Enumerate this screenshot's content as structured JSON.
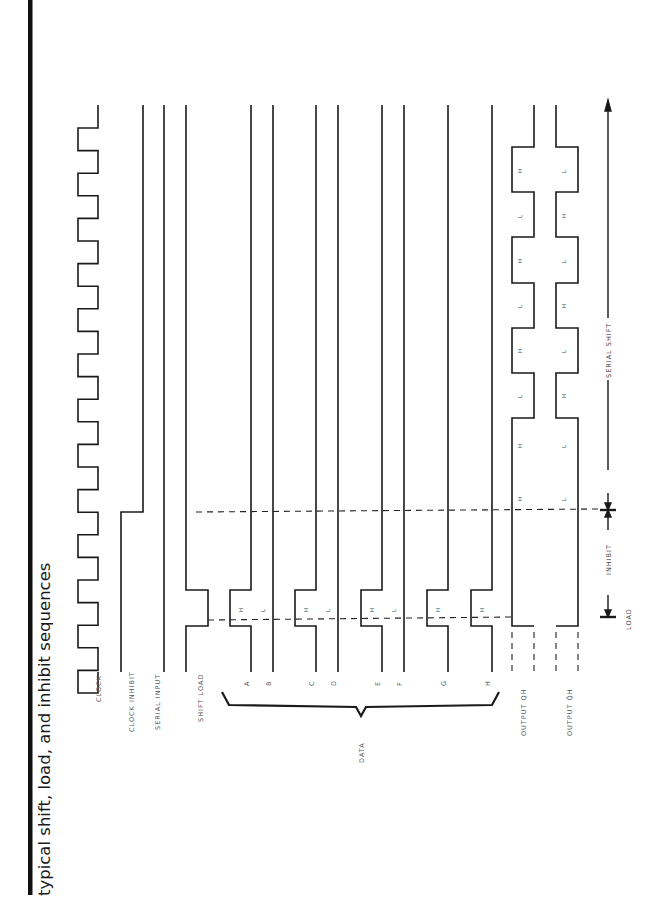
{
  "page": {
    "title": "typical shift, load, and inhibit sequences",
    "orientation": "rotated-90-ccw"
  },
  "signals": [
    {
      "id": "clock",
      "label": "CLOCK",
      "x": 98
    },
    {
      "id": "clock-inhibit",
      "label": "CLOCK INHIBIT",
      "x": 143
    },
    {
      "id": "serial-input",
      "label": "SERIAL INPUT",
      "x": 164
    },
    {
      "id": "shift-load",
      "label": "SHIFT LOAD",
      "x": 186
    },
    {
      "id": "data-a",
      "label": "A",
      "x": 251,
      "level": "H"
    },
    {
      "id": "data-b",
      "label": "B",
      "x": 273,
      "level": "L"
    },
    {
      "id": "data-c",
      "label": "C",
      "x": 316,
      "level": "H"
    },
    {
      "id": "data-d",
      "label": "D",
      "x": 338,
      "level": "L"
    },
    {
      "id": "data-e",
      "label": "E",
      "x": 382,
      "level": "H"
    },
    {
      "id": "data-f",
      "label": "F",
      "x": 404,
      "level": "L"
    },
    {
      "id": "data-g",
      "label": "G",
      "x": 448,
      "level": "H"
    },
    {
      "id": "data-h",
      "label": "H",
      "x": 492,
      "level": "H"
    },
    {
      "id": "output-qh",
      "label": "OUTPUT QH",
      "x": 534
    },
    {
      "id": "output-qh-bar",
      "label": "OUTPUT Q̄H",
      "x": 578
    }
  ],
  "labels": {
    "data_group": "DATA",
    "serial_shift": "SERIAL SHIFT",
    "inhibit": "INHIBIT",
    "load": "LOAD"
  },
  "chart_data": {
    "type": "timing-diagram",
    "title": "typical shift, load, and inhibit sequences",
    "time_axis": "vertical (top = later, bottom = earlier; rotated page)",
    "phases": [
      "LOAD",
      "INHIBIT",
      "SERIAL SHIFT"
    ],
    "data_inputs": {
      "A": "H",
      "B": "L",
      "C": "H",
      "D": "L",
      "E": "H",
      "F": "L",
      "G": "H",
      "H": "H"
    },
    "output_qh_sequence": [
      "H",
      "H",
      "L",
      "H",
      "L",
      "H",
      "L",
      "H"
    ],
    "output_qh_bar_sequence": [
      "L",
      "L",
      "H",
      "L",
      "H",
      "L",
      "H",
      "L"
    ],
    "clock_pulses": 13
  }
}
